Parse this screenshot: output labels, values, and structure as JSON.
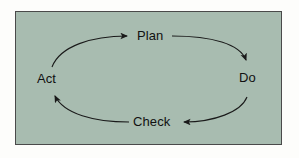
{
  "diagram": {
    "type": "cycle",
    "direction": "clockwise",
    "panel": {
      "fill_color": "#a8bcb0",
      "border_color": "#4a4a4a",
      "page_background": "#fdfdfb"
    },
    "arrow_color": "#1a1a1a",
    "text_color": "#111111",
    "nodes": [
      {
        "id": "plan",
        "label": "Plan",
        "position": "top"
      },
      {
        "id": "do",
        "label": "Do",
        "position": "right"
      },
      {
        "id": "check",
        "label": "Check",
        "position": "bottom"
      },
      {
        "id": "act",
        "label": "Act",
        "position": "left"
      }
    ],
    "arrows": [
      {
        "id": "plan-to-do",
        "from": "Plan",
        "to": "Do",
        "style": "curved"
      },
      {
        "id": "do-to-check",
        "from": "Do",
        "to": "Check",
        "style": "curved"
      },
      {
        "id": "check-to-act",
        "from": "Check",
        "to": "Act",
        "style": "curved"
      },
      {
        "id": "act-to-plan",
        "from": "Act",
        "to": "Plan",
        "style": "curved"
      }
    ]
  }
}
